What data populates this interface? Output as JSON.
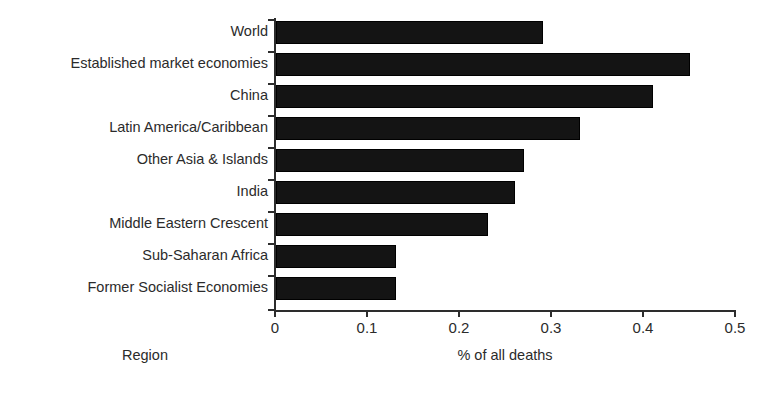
{
  "chart_data": {
    "type": "bar",
    "orientation": "horizontal",
    "title": "",
    "xlabel": "% of all deaths",
    "ylabel": "Region",
    "xlim": [
      0,
      0.5
    ],
    "xticks": [
      "0",
      "0.1",
      "0.2",
      "0.3",
      "0.4",
      "0.5"
    ],
    "xtick_values": [
      0,
      0.1,
      0.2,
      0.3,
      0.4,
      0.5
    ],
    "grid": false,
    "legend": false,
    "bar_color": "#141414",
    "axis_color": "#2d2d2d",
    "categories": [
      "World",
      "Established market economies",
      "China",
      "Latin America/Caribbean",
      "Other Asia & Islands",
      "India",
      "Middle Eastern Crescent",
      "Sub-Saharan Africa",
      "Former Socialist Economies"
    ],
    "values": [
      0.29,
      0.45,
      0.41,
      0.33,
      0.27,
      0.26,
      0.23,
      0.13,
      0.13
    ]
  }
}
